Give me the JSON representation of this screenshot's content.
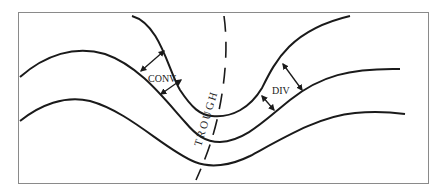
{
  "diagram": {
    "type": "upper-air trough schematic",
    "labels": {
      "convergence": "CONV",
      "divergence": "DIV",
      "trough": "TROUGH"
    },
    "elements": [
      "frame",
      "height-contour-upper",
      "height-contour-middle",
      "height-contour-lower",
      "trough-axis-dashed",
      "convergence-arrows",
      "divergence-arrows"
    ],
    "colors": {
      "line": "#1a1a1a",
      "frame": "#8a8a8a",
      "background": "#ffffff"
    }
  }
}
